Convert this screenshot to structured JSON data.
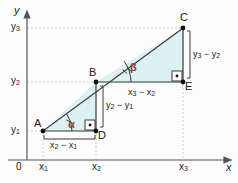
{
  "figure": {
    "colors": {
      "triangle_fill": "#ddf0f2",
      "stroke": "#3a3a3a",
      "axis": "#555555",
      "guide": "#cfcfcf",
      "angle_label": "#a03a3a",
      "point_dot": "#111111",
      "background": "#fdfdfd"
    },
    "axes": {
      "x_label": "x",
      "y_label": "y",
      "origin_label": "0"
    },
    "x_ticks": [
      {
        "id": "x1",
        "base": "x",
        "sub": "1"
      },
      {
        "id": "x2",
        "base": "x",
        "sub": "2"
      },
      {
        "id": "x3",
        "base": "x",
        "sub": "3"
      }
    ],
    "y_ticks": [
      {
        "id": "y1",
        "base": "y",
        "sub": "1"
      },
      {
        "id": "y2",
        "base": "y",
        "sub": "2"
      },
      {
        "id": "y3",
        "base": "y",
        "sub": "3"
      }
    ],
    "points": [
      {
        "id": "A",
        "label": "A"
      },
      {
        "id": "B",
        "label": "B"
      },
      {
        "id": "C",
        "label": "C"
      },
      {
        "id": "D",
        "label": "D"
      },
      {
        "id": "E",
        "label": "E"
      }
    ],
    "angles": [
      {
        "id": "alpha",
        "label": "α",
        "ticks": 1,
        "at_point": "A"
      },
      {
        "id": "beta",
        "label": "β",
        "ticks": 2,
        "at_point": "B"
      }
    ],
    "right_angles": [
      {
        "id": "right-angle-d",
        "at_point": "D"
      },
      {
        "id": "right-angle-e",
        "at_point": "E"
      }
    ],
    "segment_labels": [
      {
        "id": "run-ad",
        "lhs": "x",
        "lhs_sub": "2",
        "op": "−",
        "rhs": "x",
        "rhs_sub": "1"
      },
      {
        "id": "rise-db",
        "lhs": "y",
        "lhs_sub": "2",
        "op": "−",
        "rhs": "y",
        "rhs_sub": "1"
      },
      {
        "id": "run-be",
        "lhs": "x",
        "lhs_sub": "3",
        "op": "−",
        "rhs": "x",
        "rhs_sub": "2"
      },
      {
        "id": "rise-ec",
        "lhs": "y",
        "lhs_sub": "3",
        "op": "−",
        "rhs": "y",
        "rhs_sub": "2"
      }
    ]
  }
}
